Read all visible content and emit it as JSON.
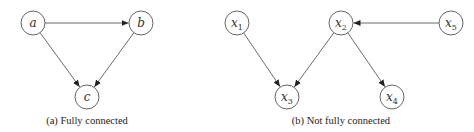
{
  "diagrams": [
    {
      "id": "a",
      "caption": "(a) Fully connected",
      "caption_pos": {
        "x": 87,
        "y": 124
      },
      "nodes": [
        {
          "id": "a",
          "label": "a",
          "sub": "",
          "x": 33,
          "y": 23
        },
        {
          "id": "b",
          "label": "b",
          "sub": "",
          "x": 141,
          "y": 23
        },
        {
          "id": "c",
          "label": "c",
          "sub": "",
          "x": 87,
          "y": 97
        }
      ],
      "edges": [
        {
          "from": "a",
          "to": "b"
        },
        {
          "from": "a",
          "to": "c"
        },
        {
          "from": "b",
          "to": "c"
        }
      ]
    },
    {
      "id": "b",
      "caption": "(b) Not fully connected",
      "caption_pos": {
        "x": 341,
        "y": 124
      },
      "nodes": [
        {
          "id": "x1",
          "label": "x",
          "sub": "1",
          "x": 237,
          "y": 23
        },
        {
          "id": "x2",
          "label": "x",
          "sub": "2",
          "x": 341,
          "y": 23
        },
        {
          "id": "x5",
          "label": "x",
          "sub": "5",
          "x": 451,
          "y": 23
        },
        {
          "id": "x3",
          "label": "x",
          "sub": "3",
          "x": 287,
          "y": 97
        },
        {
          "id": "x4",
          "label": "x",
          "sub": "4",
          "x": 392,
          "y": 97
        }
      ],
      "edges": [
        {
          "from": "x1",
          "to": "x3"
        },
        {
          "from": "x2",
          "to": "x3"
        },
        {
          "from": "x2",
          "to": "x4"
        },
        {
          "from": "x5",
          "to": "x2"
        }
      ]
    }
  ],
  "style": {
    "node_radius": 12,
    "stroke_color": "#555555",
    "edge_color": "#444444",
    "background": "#ffffff"
  }
}
